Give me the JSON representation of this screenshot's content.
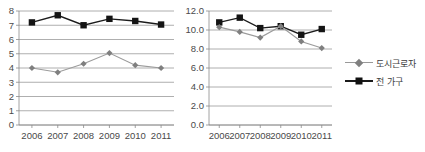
{
  "legend": {
    "position": "right",
    "items": [
      {
        "label": "도시근로자",
        "marker": "diamond-marker-icon",
        "color": "#808080"
      },
      {
        "label": "전 가구",
        "marker": "square-marker-icon",
        "color": "#111111"
      }
    ]
  },
  "chart_data": [
    {
      "id": "left",
      "type": "line",
      "title": "",
      "xlabel": "",
      "ylabel": "",
      "categories": [
        "2006",
        "2007",
        "2008",
        "2009",
        "2010",
        "2011"
      ],
      "ylim": [
        0,
        8
      ],
      "yticks": [
        "0",
        "1",
        "2",
        "3",
        "4",
        "5",
        "6",
        "7",
        "8"
      ],
      "ytick_values": [
        0,
        1,
        2,
        3,
        4,
        5,
        6,
        7,
        8
      ],
      "grid": true,
      "series": [
        {
          "name": "전 가구",
          "marker": "square",
          "color": "#111111",
          "values": [
            7.2,
            7.7,
            7.0,
            7.45,
            7.3,
            7.05
          ]
        },
        {
          "name": "도시근로자",
          "marker": "diamond",
          "color": "#808080",
          "values": [
            4.0,
            3.7,
            4.3,
            5.05,
            4.2,
            4.0
          ]
        }
      ]
    },
    {
      "id": "right",
      "type": "line",
      "title": "",
      "xlabel": "",
      "ylabel": "",
      "categories": [
        "2006",
        "2007",
        "2008",
        "2009",
        "2010",
        "2011"
      ],
      "ylim": [
        0,
        12
      ],
      "yticks": [
        "0.0",
        "2.0",
        "4.0",
        "6.0",
        "8.0",
        "10.0",
        "12.0"
      ],
      "ytick_values": [
        0,
        2,
        4,
        6,
        8,
        10,
        12
      ],
      "grid": true,
      "series": [
        {
          "name": "전 가구",
          "marker": "square",
          "color": "#111111",
          "values": [
            10.8,
            11.3,
            10.2,
            10.4,
            9.5,
            10.1
          ]
        },
        {
          "name": "도시근로자",
          "marker": "diamond",
          "color": "#808080",
          "values": [
            10.3,
            9.8,
            9.2,
            10.4,
            8.8,
            8.1
          ]
        }
      ]
    }
  ]
}
